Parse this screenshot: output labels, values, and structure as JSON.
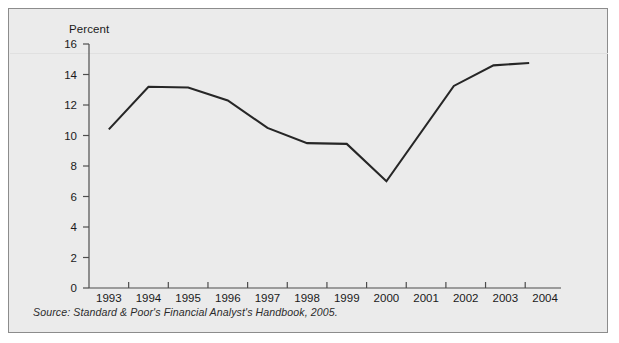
{
  "figure": {
    "source_note": "Source: Standard & Poor's Financial Analyst's Handbook, 2005.",
    "frame_color": "#8c8c8c",
    "background_color": "#ebebeb",
    "line_color": "#262626"
  },
  "chart_data": {
    "type": "line",
    "title": "",
    "ylabel": "Percent",
    "xlabel": "",
    "ylim": [
      0,
      16
    ],
    "xlim": [
      1993,
      2004.6
    ],
    "grid": false,
    "legend": "none",
    "ytick_labels": [
      "16",
      "14",
      "12",
      "10",
      "8",
      "6",
      "4",
      "2",
      "0"
    ],
    "ytick_values": [
      16,
      14,
      12,
      10,
      8,
      6,
      4,
      2,
      0
    ],
    "xtick_labels": [
      "1993",
      "1994",
      "1995",
      "1996",
      "1997",
      "1998",
      "1999",
      "2000",
      "2001",
      "2002",
      "2003",
      "2004"
    ],
    "xtick_values": [
      1993,
      1994,
      1995,
      1996,
      1997,
      1998,
      1999,
      2000,
      2001,
      2002,
      2003,
      2004
    ],
    "series": [
      {
        "name": "Percent",
        "x": [
          1993.5,
          1994.5,
          1995.5,
          1996.5,
          1997.5,
          1998.5,
          1999.5,
          2000.5,
          2002.2,
          2003.2,
          2004.1
        ],
        "values": [
          10.4,
          13.2,
          13.15,
          12.3,
          10.5,
          9.5,
          9.45,
          7.0,
          13.25,
          14.6,
          14.75
        ]
      }
    ]
  }
}
